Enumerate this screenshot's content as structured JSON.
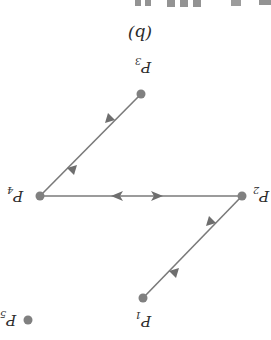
{
  "figure": {
    "caption": "(b)",
    "orientation": "rotated 180°",
    "colors": {
      "edge": "#7a7a7a",
      "node": "#808080",
      "text": "#2b2b2b",
      "background": "#ffffff"
    },
    "nodes": [
      {
        "id": "P1",
        "label": "P",
        "sub": "1"
      },
      {
        "id": "P2",
        "label": "P",
        "sub": "2"
      },
      {
        "id": "P3",
        "label": "P",
        "sub": "3"
      },
      {
        "id": "P4",
        "label": "P",
        "sub": "4"
      },
      {
        "id": "P5",
        "label": "P",
        "sub": "5"
      }
    ],
    "edges": [
      {
        "from": "P3",
        "to": "P4",
        "type": "bidirectional"
      },
      {
        "from": "P4",
        "to": "P2",
        "type": "bidirectional"
      },
      {
        "from": "P2",
        "to": "P1",
        "type": "bidirectional"
      }
    ],
    "isolated_nodes": [
      "P5"
    ]
  }
}
